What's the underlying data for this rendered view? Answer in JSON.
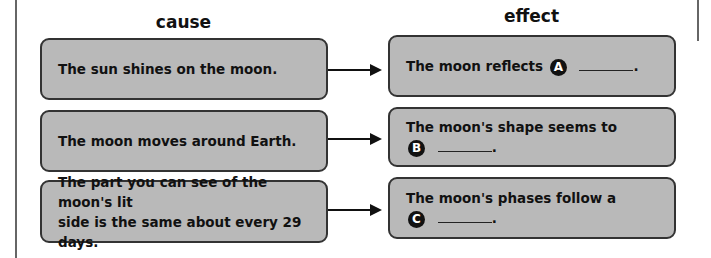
{
  "headers": {
    "cause": "cause",
    "effect": "effect"
  },
  "rows": [
    {
      "cause": "The sun shines on the moon.",
      "effect_prefix": "The moon reflects",
      "effect_line2": "",
      "marker": "A",
      "suffix": "."
    },
    {
      "cause": "The moon moves around Earth.",
      "effect_prefix": "The moon's shape seems to",
      "marker": "B",
      "suffix": "."
    },
    {
      "cause": "The part you can see of the moon's lit\nside is the same about every 29 days.",
      "effect_prefix": "The moon's phases follow a",
      "marker": "C",
      "suffix": "."
    }
  ],
  "colors": {
    "box_fill": "#b9b9b9",
    "box_border": "#333333",
    "badge": "#111111"
  }
}
